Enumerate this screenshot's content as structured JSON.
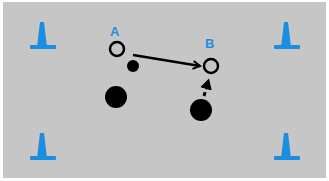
{
  "diagram": {
    "type": "drill-diagram",
    "colors": {
      "field": "#c6c6c6",
      "cone": "#1a8ee0",
      "label": "#1f8fdc",
      "player": "#000000"
    },
    "cones": [
      {
        "id": "cone-top-left",
        "x": 42,
        "y": 45
      },
      {
        "id": "cone-top-right",
        "x": 286,
        "y": 45
      },
      {
        "id": "cone-bottom-left",
        "x": 42,
        "y": 160
      },
      {
        "id": "cone-bottom-right",
        "x": 286,
        "y": 160
      }
    ],
    "markers": [
      {
        "id": "A",
        "label": "A",
        "x": 117,
        "y": 49
      },
      {
        "id": "B",
        "label": "B",
        "x": 211,
        "y": 66
      }
    ],
    "balls": [
      {
        "id": "ball-near-a",
        "x": 133,
        "y": 66,
        "r": 6
      },
      {
        "id": "player-left",
        "x": 116,
        "y": 97,
        "r": 11
      },
      {
        "id": "player-right",
        "x": 201,
        "y": 110,
        "r": 11
      }
    ],
    "arrows": [
      {
        "id": "pass-a-to-b",
        "style": "solid",
        "from": [
          133,
          54
        ],
        "to": [
          201,
          66
        ]
      },
      {
        "id": "run-to-b",
        "style": "dashed",
        "from": [
          204,
          96
        ],
        "to": [
          210,
          79
        ]
      }
    ]
  }
}
